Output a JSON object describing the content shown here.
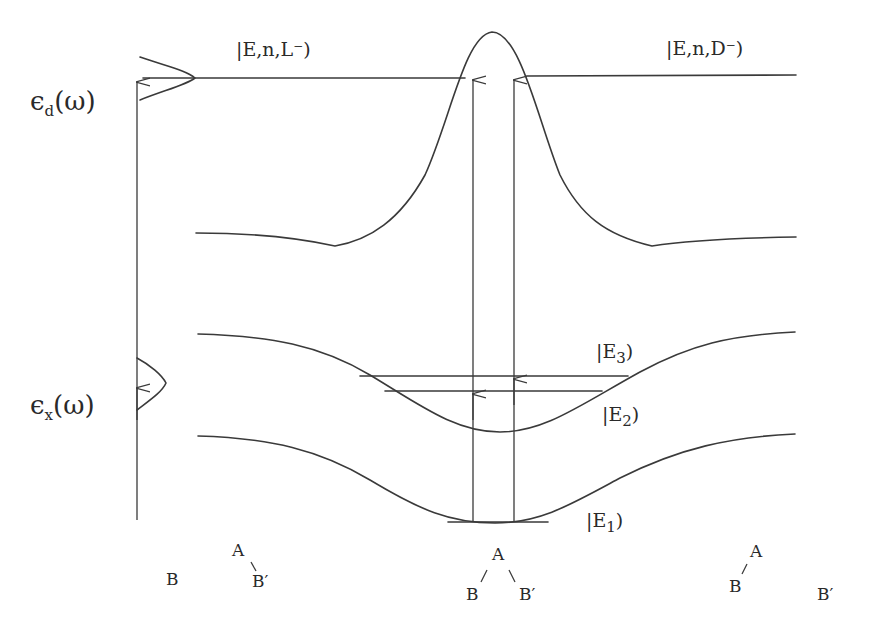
{
  "diagram": {
    "title": "",
    "left_labels": {
      "eps_d": {
        "symbol": "ϵ",
        "sub": "d",
        "arg": "(ω)"
      },
      "eps_x": {
        "symbol": "ϵ",
        "sub": "x",
        "arg": "(ω)"
      }
    },
    "states": {
      "L_minus": "|E,n,L⁻)",
      "D_minus": "|E,n,D⁻)",
      "E3": {
        "ket": "|E",
        "sub": "3",
        "close": ")"
      },
      "E2": {
        "ket": "|E",
        "sub": "2",
        "close": ")"
      },
      "E1": {
        "ket": "|E",
        "sub": "1",
        "close": ")"
      }
    },
    "geometries": {
      "left": {
        "B": "B",
        "A": "A",
        "Bprime": "B′"
      },
      "center": {
        "A": "A",
        "B": "B",
        "Bprime": "B′"
      },
      "right": {
        "A": "A",
        "B": "B",
        "Bprime": "B′"
      }
    },
    "colors": {
      "line": "#3a3a3a",
      "text": "#2a2a2a",
      "background": "#ffffff"
    }
  }
}
